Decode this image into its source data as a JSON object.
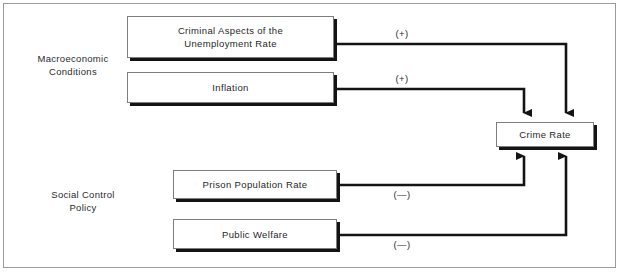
{
  "figure": {
    "type": "causal-path-diagram",
    "title": "",
    "background_color": "#ffffff",
    "frame_color": "#9a9a9a",
    "line_color": "#141414",
    "box_border_color": "#7d7d7d",
    "shadow_color": "#141414"
  },
  "groups": [
    {
      "id": "macroeconomic",
      "label": "Macroeconomic\nConditions"
    },
    {
      "id": "social-control",
      "label": "Social Control\nPolicy"
    }
  ],
  "nodes": [
    {
      "id": "unemployment",
      "label": "Criminal  Aspects of the\nUnemployment Rate"
    },
    {
      "id": "inflation",
      "label": "Inflation"
    },
    {
      "id": "prison-population",
      "label": "Prison Population Rate"
    },
    {
      "id": "public-welfare",
      "label": "Public Welfare"
    },
    {
      "id": "crime-rate",
      "label": "Crime Rate"
    }
  ],
  "edges": [
    {
      "id": "unemployment-to-crime",
      "from": "unemployment",
      "to": "crime-rate",
      "sign": "(+)"
    },
    {
      "id": "inflation-to-crime",
      "from": "inflation",
      "to": "crime-rate",
      "sign": "(+)"
    },
    {
      "id": "prison-to-crime",
      "from": "prison-population",
      "to": "crime-rate",
      "sign": "(—)"
    },
    {
      "id": "welfare-to-crime",
      "from": "public-welfare",
      "to": "crime-rate",
      "sign": "(—)"
    }
  ]
}
